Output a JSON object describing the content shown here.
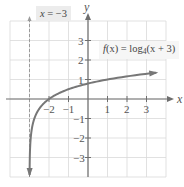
{
  "chart_data": {
    "type": "line",
    "title": "",
    "function": "f(x) = log_4(x + 3)",
    "base": 4,
    "shift": 3,
    "series": [
      {
        "name": "f(x) = log4(x + 3)",
        "points": [
          {
            "x": -2.9955,
            "y": -3.9
          },
          {
            "x": -2.9375,
            "y": -2
          },
          {
            "x": -2.75,
            "y": -1
          },
          {
            "x": -2,
            "y": 0
          },
          {
            "x": 1,
            "y": 1
          },
          {
            "x": 3.5,
            "y": 1.35
          }
        ],
        "color": "#777777"
      }
    ],
    "asymptote": {
      "type": "vertical",
      "x": -3,
      "label": "x = −3",
      "style": "dashed"
    },
    "xlabel": "x",
    "ylabel": "y",
    "xlim": [
      -4,
      4
    ],
    "ylim": [
      -4,
      4
    ],
    "x_ticks": [
      -2,
      -1,
      1,
      2,
      3
    ],
    "x_tick_labels": [
      "−2",
      "−1",
      "1",
      "2",
      "3"
    ],
    "y_ticks": [
      -3,
      -2,
      -1,
      1,
      2,
      3
    ],
    "y_tick_labels": [
      "−3",
      "−2",
      "−1",
      "1",
      "2",
      "3"
    ],
    "grid": true,
    "legend": null
  },
  "labels": {
    "asymptote_var": "x",
    "asymptote_eq": " = −3",
    "func_name": "f",
    "func_arg": "(x) = log",
    "func_base": "4",
    "func_rest": "(x + 3)"
  },
  "axes": {
    "x_axis_label": "x",
    "y_axis_label": "y"
  },
  "layout_px": {
    "origin_x": 88,
    "origin_y": 99,
    "unit": 19.5
  }
}
